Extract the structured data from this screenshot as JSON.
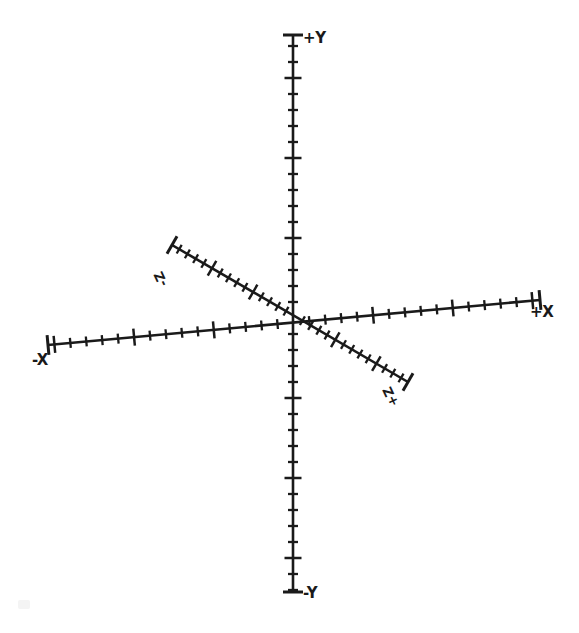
{
  "figure": {
    "background_color": "#ffffff",
    "ink_color": "#1a1a1a",
    "width": 579,
    "height": 633,
    "style": "scanned hand-drawn line art"
  },
  "labels": {
    "y_positive": "+Y",
    "y_negative": "-Y",
    "x_positive": "+X",
    "x_negative": "-X",
    "z_positive": "+Z",
    "z_negative": "-Z"
  },
  "chart_data": {
    "type": "line",
    "xlabel": "",
    "ylabel": "",
    "grid": false,
    "legend": "none",
    "origin": {
      "x": 293,
      "y": 318
    },
    "axes": [
      {
        "name": "Y",
        "positive_label": "+Y",
        "negative_label": "-Y",
        "start": {
          "x": 293,
          "y": 35
        },
        "end": {
          "x": 293,
          "y": 592
        },
        "orientation": "vertical",
        "tick_spacing_px": 16,
        "major_tick_every": 5,
        "tick_count": 35,
        "endcaps": true
      },
      {
        "name": "X",
        "positive_label": "+X",
        "negative_label": "-X",
        "start": {
          "x": 48,
          "y": 345
        },
        "end": {
          "x": 540,
          "y": 300
        },
        "orientation": "near-horizontal, tilted up to the right",
        "tick_spacing_px": 16,
        "major_tick_every": 5,
        "tick_count": 31,
        "endcaps": true
      },
      {
        "name": "Z",
        "positive_label": "+Z",
        "negative_label": "-Z",
        "start": {
          "x": 172,
          "y": 245
        },
        "end": {
          "x": 408,
          "y": 382
        },
        "orientation": "diagonal, upper-left to lower-right",
        "tick_spacing_px": 9.5,
        "major_tick_every": 5,
        "tick_count": 29,
        "endcaps": true
      }
    ]
  }
}
